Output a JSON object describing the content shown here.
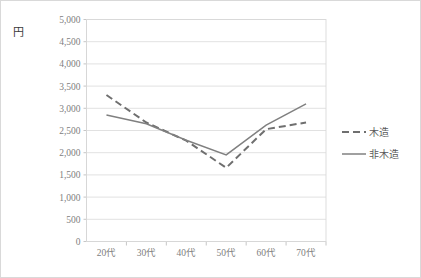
{
  "chart_data": {
    "type": "line",
    "title": "",
    "xlabel": "",
    "ylabel": "円",
    "ylim": [
      0,
      5000
    ],
    "ytick_step": 500,
    "grid": true,
    "legend_position": "right",
    "categories": [
      "20代",
      "30代",
      "40代",
      "50代",
      "60代",
      "70代"
    ],
    "ytick_labels": [
      "5,000",
      "4,500",
      "4,000",
      "3,500",
      "3,000",
      "2,500",
      "2,000",
      "1,500",
      "1,000",
      "500",
      "0"
    ],
    "series": [
      {
        "name": "木造",
        "style": "dashed",
        "color": "#6f6f6f",
        "values": [
          3300,
          2680,
          2270,
          1660,
          2530,
          2680
        ]
      },
      {
        "name": "非木造",
        "style": "solid",
        "color": "#808080",
        "values": [
          2850,
          2650,
          2280,
          1950,
          2620,
          3100
        ]
      }
    ]
  },
  "legend": {
    "items": [
      {
        "label": "木造",
        "style": "dashed"
      },
      {
        "label": "非木造",
        "style": "solid"
      }
    ]
  }
}
